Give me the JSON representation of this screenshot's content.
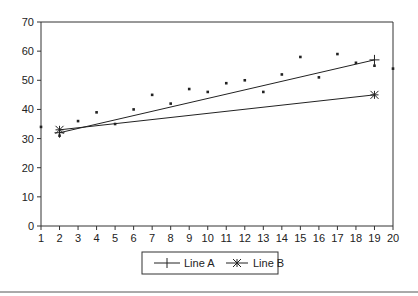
{
  "chart_data": {
    "type": "scatter",
    "title": "",
    "xlabel": "",
    "ylabel": "",
    "xlim": [
      1,
      20
    ],
    "ylim": [
      0,
      70
    ],
    "x_ticks": [
      1,
      2,
      3,
      4,
      5,
      6,
      7,
      8,
      9,
      10,
      11,
      12,
      13,
      14,
      15,
      16,
      17,
      18,
      19,
      20
    ],
    "y_ticks": [
      0,
      10,
      20,
      30,
      40,
      50,
      60,
      70
    ],
    "grid": false,
    "legend_position": "bottom",
    "scatter_points": {
      "x": [
        1,
        2,
        3,
        4,
        5,
        6,
        7,
        8,
        9,
        10,
        11,
        12,
        13,
        14,
        15,
        16,
        17,
        18,
        19,
        20
      ],
      "y": [
        34,
        31,
        36,
        39,
        35,
        40,
        45,
        42,
        47,
        46,
        49,
        50,
        46,
        52,
        58,
        51,
        59,
        56,
        55,
        54
      ]
    },
    "series": [
      {
        "name": "Line A",
        "marker": "plus",
        "x": [
          2,
          19
        ],
        "y": [
          32,
          57
        ]
      },
      {
        "name": "Line B",
        "marker": "asterisk",
        "x": [
          2,
          19
        ],
        "y": [
          33,
          45
        ]
      }
    ]
  },
  "legend": {
    "items": [
      {
        "label": "Line A",
        "marker": "plus-marker-icon"
      },
      {
        "label": "Line B",
        "marker": "asterisk-marker-icon"
      }
    ]
  }
}
